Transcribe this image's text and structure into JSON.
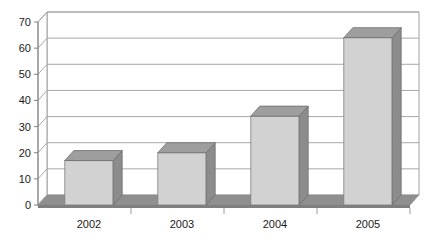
{
  "chart_data": {
    "type": "bar",
    "title": "",
    "subtitle": "",
    "xlabel": "",
    "ylabel": "",
    "categories": [
      "2002",
      "2003",
      "2004",
      "2005"
    ],
    "values": [
      17,
      20,
      34,
      64
    ],
    "series": [
      {
        "name": "Series 1",
        "values": [
          17,
          20,
          34,
          64
        ]
      }
    ],
    "ylim": [
      0,
      70
    ],
    "ytick_labels": [
      "0",
      "10",
      "20",
      "30",
      "40",
      "50",
      "60",
      "70"
    ],
    "ytick_values": [
      0,
      10,
      20,
      30,
      40,
      50,
      60,
      70
    ],
    "grid": true,
    "grid_axis": "y",
    "legend": false,
    "legend_position": "none",
    "style": "3d-column",
    "colors": {
      "bar_front": "#d2d2d2",
      "bar_side": "#8c8c8c",
      "bar_top": "#9e9e9e",
      "floor": "#8f8f8f",
      "floor_front": "#7f7f7f",
      "wall": "#ffffff",
      "grid_line": "#a8a8a8",
      "axis_line": "#808080",
      "text": "#1a1a1a"
    }
  },
  "axes": {
    "y_ticks": [
      {
        "label": "70",
        "value": 70
      },
      {
        "label": "60",
        "value": 60
      },
      {
        "label": "50",
        "value": 50
      },
      {
        "label": "40",
        "value": 40
      },
      {
        "label": "30",
        "value": 30
      },
      {
        "label": "20",
        "value": 20
      },
      {
        "label": "10",
        "value": 10
      },
      {
        "label": "0",
        "value": 0
      }
    ],
    "x_ticks": [
      {
        "label": "2002"
      },
      {
        "label": "2003"
      },
      {
        "label": "2004"
      },
      {
        "label": "2005"
      }
    ]
  }
}
